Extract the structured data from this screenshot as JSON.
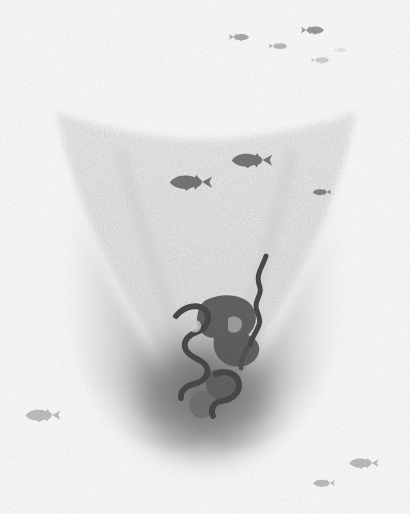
{
  "canvas": {
    "width": 410,
    "height": 514,
    "background_color": "#ffffff",
    "medium": "grainy grayscale sonar-style illustration",
    "description": "Monochrome textured illustration of a funnel / V-shaped underwater basin with dark meandering channel squiggles near the bottom centre and small fish silhouettes scattered across the white water above and below."
  },
  "palette": {
    "background": "#ffffff",
    "grain_light": "#f2f2f2",
    "grain_mid": "#cfcfcf",
    "funnel_fill": "#dcdcdc",
    "funnel_shadow": "#a8a8a8",
    "deep_shadow": "#6e6e6e",
    "squiggle_dark": "#4a4a4a",
    "squiggle_mid": "#5d5d5d",
    "fish_dark": "#555555",
    "fish_mid": "#7b7b7b",
    "fish_light": "#a9a9a9",
    "fish_faint": "#c4c4c4"
  },
  "structures": [
    {
      "id": "funnel",
      "name": "funnel-basin",
      "label": "Funnel-shaped basin",
      "top_left_x": 55,
      "top_right_x": 358,
      "top_y": 108,
      "throat_y": 300,
      "bottom_y": 440,
      "bottom_center_x": 205
    },
    {
      "id": "left-wall",
      "name": "left-slope-shadow",
      "label": "Left slope shadow",
      "x": 55,
      "y": 180,
      "width": 110,
      "height": 250
    },
    {
      "id": "right-wall",
      "name": "right-slope-shadow",
      "label": "Right slope shadow",
      "x": 255,
      "y": 175,
      "width": 110,
      "height": 255
    },
    {
      "id": "deep-pool",
      "name": "deep-basin-shadow",
      "label": "Deep basin shadow",
      "cx": 205,
      "cy": 390,
      "rx": 95,
      "ry": 75
    }
  ],
  "squiggles": [
    {
      "id": "sq1",
      "name": "channel-squiggle-upper-right",
      "label": "Upper right channel",
      "d": "M 263 258 C 262 270, 258 276, 261 285 C 264 293, 259 297, 259 304 C 259 311, 264 314, 262 322 C 260 330, 256 334, 254 342",
      "stroke_width": 5,
      "color": "#4a4a4a"
    },
    {
      "id": "sq2",
      "name": "channel-squiggle-left-hook",
      "label": "Left hooked channel",
      "d": "M 180 313 C 187 306, 198 305, 203 311 C 208 317, 204 325, 196 328 C 188 331, 182 338, 186 346 C 190 354, 200 355, 205 362 C 210 369, 204 377, 196 379 C 188 381, 183 386, 184 393",
      "stroke_width": 6,
      "color": "#4a4a4a"
    },
    {
      "id": "sq3",
      "name": "channel-squiggle-lower-loop",
      "label": "Lower looping channel",
      "d": "M 216 370 C 224 366, 234 369, 236 377 C 238 385, 231 392, 224 394 C 217 396, 213 403, 217 409",
      "stroke_width": 6,
      "color": "#4a4a4a"
    },
    {
      "id": "blob1",
      "name": "channel-blob-center",
      "label": "Central dark blob",
      "cx": 228,
      "cy": 320,
      "rx": 26,
      "ry": 22
    },
    {
      "id": "blob2",
      "name": "channel-blob-lower",
      "label": "Lower dark blob",
      "cx": 235,
      "cy": 352,
      "rx": 18,
      "ry": 16
    }
  ],
  "fish": [
    {
      "id": "f1",
      "name": "fish-top-left-small",
      "x": 228,
      "y": 37,
      "length": 22,
      "facing": "left",
      "tone": "#8c8c8c",
      "opacity": 0.75
    },
    {
      "id": "f2",
      "name": "fish-top-mid-small",
      "x": 268,
      "y": 46,
      "length": 20,
      "facing": "left",
      "tone": "#9a9a9a",
      "opacity": 0.7
    },
    {
      "id": "f3",
      "name": "fish-top-right-upper",
      "x": 300,
      "y": 30,
      "length": 25,
      "facing": "left",
      "tone": "#7f7f7f",
      "opacity": 0.8
    },
    {
      "id": "f4",
      "name": "fish-top-right-faint",
      "x": 333,
      "y": 50,
      "length": 14,
      "facing": "left",
      "tone": "#cccccc",
      "opacity": 0.55
    },
    {
      "id": "f5",
      "name": "fish-top-right-lower",
      "x": 310,
      "y": 60,
      "length": 20,
      "facing": "left",
      "tone": "#b0b0b0",
      "opacity": 0.6
    },
    {
      "id": "f6",
      "name": "fish-center-upper-large",
      "x": 230,
      "y": 160,
      "length": 44,
      "facing": "right",
      "tone": "#6a6a6a",
      "opacity": 0.92
    },
    {
      "id": "f7",
      "name": "fish-center-lower-large",
      "x": 168,
      "y": 182,
      "length": 46,
      "facing": "right",
      "tone": "#6a6a6a",
      "opacity": 0.92
    },
    {
      "id": "f8",
      "name": "fish-right-edge",
      "x": 312,
      "y": 192,
      "length": 20,
      "facing": "right",
      "tone": "#6f6f6f",
      "opacity": 0.85
    },
    {
      "id": "f9",
      "name": "fish-bottom-left",
      "x": 24,
      "y": 415,
      "length": 38,
      "facing": "right",
      "tone": "#a0a0a0",
      "opacity": 0.7
    },
    {
      "id": "f10",
      "name": "fish-bottom-right-upper",
      "x": 348,
      "y": 463,
      "length": 32,
      "facing": "right",
      "tone": "#9c9c9c",
      "opacity": 0.7
    },
    {
      "id": "f11",
      "name": "fish-bottom-right-lower",
      "x": 312,
      "y": 483,
      "length": 24,
      "facing": "right",
      "tone": "#9c9c9c",
      "opacity": 0.7
    }
  ]
}
